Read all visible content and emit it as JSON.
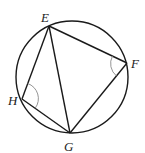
{
  "diagram": {
    "type": "inscribed-quadrilateral",
    "circle": {
      "cx": 72,
      "cy": 77,
      "r": 56
    },
    "points": {
      "E": {
        "x": 49,
        "y": 26,
        "label": "E",
        "lx": 41,
        "ly": 22
      },
      "F": {
        "x": 127,
        "y": 63,
        "label": "F",
        "lx": 131,
        "ly": 68
      },
      "G": {
        "x": 70,
        "y": 133,
        "label": "G",
        "lx": 64,
        "ly": 151
      },
      "H": {
        "x": 22,
        "y": 99,
        "label": "H",
        "lx": 8,
        "ly": 105
      }
    },
    "segments": [
      "EF",
      "FG",
      "GH",
      "HE",
      "EG"
    ],
    "angle_marks": [
      "F",
      "H"
    ],
    "stroke_color": "#1a1a1a",
    "angle_mark_color": "#888888"
  }
}
